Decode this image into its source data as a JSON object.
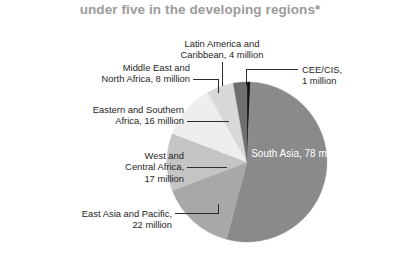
{
  "title": "under five in the developing regions*",
  "chart_data": {
    "type": "pie",
    "title": "under five in the developing regions*",
    "unit": "million",
    "total": 146,
    "legend_position": "callout-labels",
    "grid": false,
    "categories": [
      "CEE/CIS",
      "South Asia",
      "East Asia and Pacific",
      "West and Central Africa",
      "Eastern and Southern Africa",
      "Middle East and North Africa",
      "Latin America and Caribbean"
    ],
    "values": [
      1,
      78,
      22,
      17,
      16,
      8,
      4
    ],
    "colors": [
      "#111111",
      "#8a8a8a",
      "#a8a8a8",
      "#c4c4c4",
      "#eeeeee",
      "#d8d8d8",
      "#6e6e6e"
    ],
    "start_angle_deg": 0,
    "direction": "clockwise",
    "slices": [
      {
        "name": "CEE/CIS",
        "value": 1,
        "color": "#111111"
      },
      {
        "name": "South Asia",
        "value": 78,
        "color": "#8a8a8a"
      },
      {
        "name": "East Asia and Pacific",
        "value": 22,
        "color": "#a8a8a8"
      },
      {
        "name": "West and Central Africa",
        "value": 17,
        "color": "#c4c4c4"
      },
      {
        "name": "Eastern and Southern Africa",
        "value": 16,
        "color": "#eeeeee"
      },
      {
        "name": "Middle East and North Africa",
        "value": 8,
        "color": "#d8d8d8"
      },
      {
        "name": "Latin America and Caribbean",
        "value": 4,
        "color": "#6e6e6e"
      }
    ]
  },
  "labels": {
    "latin_america": {
      "line1": "Latin America and",
      "line2": "Caribbean, 4 million"
    },
    "cee_cis": {
      "line1": "CEE/CIS,",
      "line2": "1 million"
    },
    "middle_east": {
      "line1": "Middle East and",
      "line2": "North Africa, 8 million"
    },
    "eastern_southern_africa": {
      "line1": "Eastern and Southern",
      "line2": "Africa, 16 million"
    },
    "west_central_africa": {
      "line1": "West and",
      "line2": "Central Africa,",
      "line3": "17 million"
    },
    "east_asia_pacific": {
      "line1": "East Asia and Pacific,",
      "line2": "22 million"
    },
    "south_asia": {
      "line1": "South Asia,",
      "line2": "78 million"
    }
  }
}
